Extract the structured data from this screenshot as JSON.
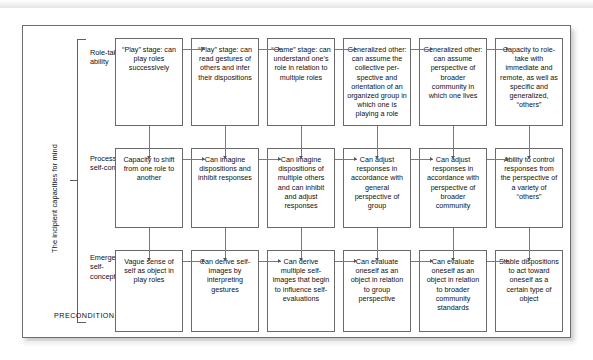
{
  "figure": {
    "vertical_caption": "The incipient capacities for mind",
    "precondition_label": "PRECONDITION",
    "row_labels": [
      "Role-taking ability",
      "Processes of self-control",
      "Emergence of self-conception"
    ],
    "rows": [
      {
        "name": "role-taking-ability",
        "cells": [
          "“Play” stage: can play roles successively",
          "“Play” stage: can read gestures of others and infer their dispositions",
          "“Game” stage: can understand one’s role in relation to multiple roles",
          "Generalized other: can assume the collective per-spective and orientation of an organized group in which one is playing a role",
          "Generalized other: can assume perspective of broader community in which one lives",
          "Capacity to role-take with immediate and remote, as well as specific and generalized, “others”"
        ]
      },
      {
        "name": "processes-of-self-control",
        "cells": [
          "Capacity to shift from one role to another",
          "Can imagine dispositions and inhibit responses",
          "Can imagine dispositions of multiple others and can inhibit and adjust responses",
          "Can adjust responses in accordance with general perspective of group",
          "Can adjust responses in accordance with perspective of broader community",
          "Ability to control responses from the perspective of a variety of “others”"
        ]
      },
      {
        "name": "emergence-of-self-conception",
        "cells": [
          "Vague sense of self as object in play roles",
          "Can derive self-images by interpreting gestures",
          "Can derive multiple self-images that begin to influence self-evaluations",
          "Can evaluate oneself as an object in relation to group perspective",
          "Can evaluate oneself as an object in relation to broader community standards",
          "Stable dispositions to act toward oneself as a certain type of object"
        ]
      }
    ]
  }
}
